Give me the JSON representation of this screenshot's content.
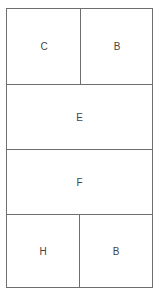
{
  "diagram": {
    "type": "grid-layout",
    "rows": [
      {
        "cells": [
          {
            "label": "C"
          },
          {
            "label": "B"
          }
        ]
      },
      {
        "cells": [
          {
            "label": "E"
          }
        ]
      },
      {
        "cells": [
          {
            "label": "F"
          }
        ]
      },
      {
        "cells": [
          {
            "label": "H"
          },
          {
            "label": "B"
          }
        ]
      }
    ],
    "colors": {
      "border": "#6f6f6f",
      "text": "#444444",
      "background": "#ffffff"
    }
  }
}
